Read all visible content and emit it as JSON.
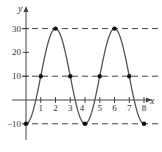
{
  "chart_data": {
    "type": "line",
    "title": "",
    "xlabel": "x",
    "ylabel": "y",
    "x_ticks": [
      1,
      2,
      3,
      4,
      5,
      6,
      7,
      8
    ],
    "y_ticks": [
      -10,
      10,
      20,
      30
    ],
    "y_tick_labels": [
      "-10",
      "10",
      "20",
      "30"
    ],
    "x_tick_labels": [
      "1",
      "2",
      "3",
      "4",
      "5",
      "6",
      "7",
      "8"
    ],
    "xlim": [
      0,
      8.5
    ],
    "ylim": [
      -15,
      35
    ],
    "function": "y = 10 - 20cos(pi*x/2)",
    "points": [
      {
        "x": 0,
        "y": -10
      },
      {
        "x": 1,
        "y": 10
      },
      {
        "x": 2,
        "y": 30
      },
      {
        "x": 3,
        "y": 10
      },
      {
        "x": 4,
        "y": -10
      },
      {
        "x": 5,
        "y": 10
      },
      {
        "x": 6,
        "y": 30
      },
      {
        "x": 7,
        "y": 10
      },
      {
        "x": 8,
        "y": -10
      }
    ],
    "dashed_lines_y": [
      30,
      10,
      -10
    ],
    "grid": false,
    "legend": null
  },
  "axis_labels": {
    "x": "x",
    "y": "y"
  }
}
